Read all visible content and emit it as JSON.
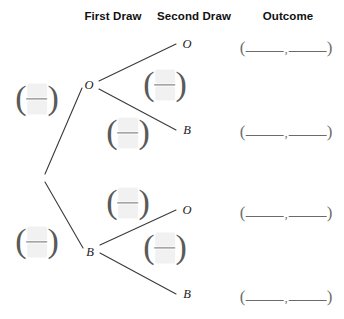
{
  "headers": [
    {
      "label": "First Draw",
      "x": 113,
      "y": 16
    },
    {
      "label": "Second Draw",
      "x": 194,
      "y": 16
    },
    {
      "label": "Outcome",
      "x": 288,
      "y": 16
    }
  ],
  "tree": {
    "line_color": "#3a3a3a",
    "line_width": 1.1,
    "root": {
      "x": 42,
      "y": 178
    },
    "branches": [
      {
        "name": "root-to-first-O",
        "x1": 45,
        "y1": 174,
        "x2": 82,
        "y2": 88
      },
      {
        "name": "root-to-first-B",
        "x1": 45,
        "y1": 182,
        "x2": 83,
        "y2": 248
      },
      {
        "name": "first-O-to-second-O",
        "x1": 99,
        "y1": 81,
        "x2": 176,
        "y2": 44
      },
      {
        "name": "first-O-to-second-B",
        "x1": 99,
        "y1": 89,
        "x2": 176,
        "y2": 130
      },
      {
        "name": "first-B-to-second-O",
        "x1": 100,
        "y1": 245,
        "x2": 176,
        "y2": 210
      },
      {
        "name": "first-B-to-second-B",
        "x1": 100,
        "y1": 253,
        "x2": 176,
        "y2": 294
      }
    ],
    "node_labels": [
      {
        "name": "first-draw-node-orange",
        "text": "O",
        "x": 89,
        "y": 85
      },
      {
        "name": "first-draw-node-blue",
        "text": "B",
        "x": 90,
        "y": 252
      },
      {
        "name": "second-draw-node-o-top",
        "text": "O",
        "x": 187,
        "y": 44
      },
      {
        "name": "second-draw-node-b-top",
        "text": "B",
        "x": 187,
        "y": 130
      },
      {
        "name": "second-draw-node-o-bottom",
        "text": "O",
        "x": 187,
        "y": 210
      },
      {
        "name": "second-draw-node-b-bottom",
        "text": "B",
        "x": 187,
        "y": 294
      }
    ]
  },
  "probability_fields": [
    {
      "name": "prob-first-draw-orange",
      "x": 37,
      "y": 99,
      "numerator": "",
      "denominator": ""
    },
    {
      "name": "prob-first-draw-blue",
      "x": 37,
      "y": 242,
      "numerator": "",
      "denominator": ""
    },
    {
      "name": "prob-second-draw-o-given-o",
      "x": 165,
      "y": 85,
      "numerator": "",
      "denominator": ""
    },
    {
      "name": "prob-second-draw-b-given-o",
      "x": 128,
      "y": 133,
      "numerator": "",
      "denominator": ""
    },
    {
      "name": "prob-second-draw-o-given-b",
      "x": 128,
      "y": 203,
      "numerator": "",
      "denominator": ""
    },
    {
      "name": "prob-second-draw-b-given-b",
      "x": 165,
      "y": 248,
      "numerator": "",
      "denominator": ""
    }
  ],
  "outcome_fields": [
    {
      "name": "outcome-oo",
      "x": 286,
      "y": 46,
      "first": "",
      "second": "",
      "separator": ","
    },
    {
      "name": "outcome-ob",
      "x": 286,
      "y": 130,
      "first": "",
      "second": "",
      "separator": ","
    },
    {
      "name": "outcome-bo",
      "x": 286,
      "y": 211,
      "first": "",
      "second": "",
      "separator": ","
    },
    {
      "name": "outcome-bb",
      "x": 286,
      "y": 295,
      "first": "",
      "second": "",
      "separator": ","
    }
  ]
}
